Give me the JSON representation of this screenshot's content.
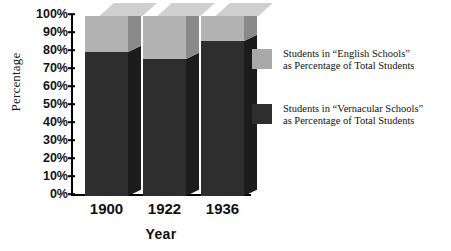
{
  "chart_data": {
    "type": "bar",
    "subtype": "stacked-3d-column",
    "title": "",
    "xlabel": "Year",
    "ylabel": "Percentage",
    "categories": [
      "1900",
      "1922",
      "1936"
    ],
    "series": [
      {
        "name": "Students in “Vernacular Schools” as Percentage of Total Students",
        "short_name": "Vernacular Schools",
        "color": "#2e2e2e",
        "values": [
          80,
          76,
          86
        ]
      },
      {
        "name": "Students in “English Schools” as Percentage of Total Students",
        "short_name": "English Schools",
        "color": "#b3b3b3",
        "values": [
          20,
          24,
          14
        ]
      }
    ],
    "ylim": [
      0,
      100
    ],
    "ytick_labels": [
      "0%",
      "10%",
      "20%",
      "30%",
      "40%",
      "50%",
      "60%",
      "70%",
      "80%",
      "90%",
      "100%"
    ],
    "ytick_values": [
      0,
      10,
      20,
      30,
      40,
      50,
      60,
      70,
      80,
      90,
      100
    ],
    "grid": false,
    "legend_position": "right",
    "stack_total": 100
  },
  "legend": {
    "entries": [
      {
        "swatch_color": "#a9a9a9",
        "line1": "Students in “English Schools”",
        "line2": "as Percentage of Total Students"
      },
      {
        "swatch_color": "#2e2e2e",
        "line1": "Students in “Vernacular Schools”",
        "line2": "as Percentage of Total Students"
      }
    ]
  }
}
